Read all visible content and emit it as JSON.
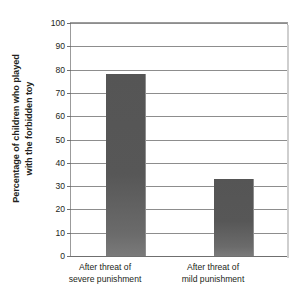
{
  "chart_data": {
    "type": "bar",
    "title": "",
    "subtitle": "",
    "xlabel": "",
    "ylabel": "Percentage of children who played with the forbidden toy",
    "ylabel_lines": [
      "Percentage of children who played",
      "with the forbidden toy"
    ],
    "categories": [
      "After threat of severe punishment",
      "After threat of mild punishment"
    ],
    "category_lines": [
      [
        "After threat of",
        "severe punishment"
      ],
      [
        "After threat of",
        "mild punishment"
      ]
    ],
    "values": [
      78,
      33
    ],
    "ylim": [
      0,
      100
    ],
    "ytick_step": 10,
    "yticks": [
      0,
      10,
      20,
      30,
      40,
      50,
      60,
      70,
      80,
      90,
      100
    ],
    "ytick_labels": [
      "0",
      "10",
      "20",
      "30",
      "40",
      "50",
      "60",
      "70",
      "80",
      "90",
      "100"
    ],
    "grid": true,
    "grid_axis": "y",
    "legend": false,
    "legend_position": "none",
    "bar_color": "#575757",
    "grid_color": "#8d8d8d",
    "axis_color": "#6f6f6f",
    "background_color": "#ffffff",
    "series": [
      {
        "name": "Percentage of children who played with the forbidden toy",
        "values": [
          78,
          33
        ]
      }
    ]
  }
}
